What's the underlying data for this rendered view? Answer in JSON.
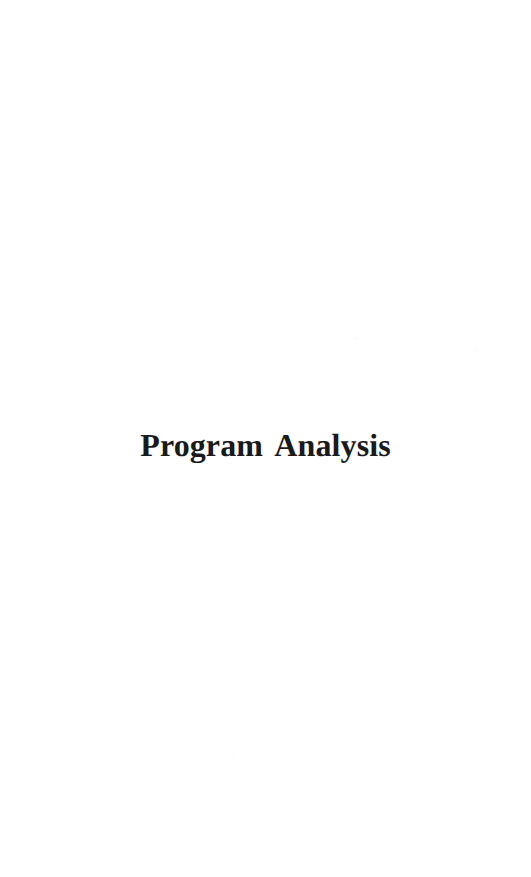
{
  "page": {
    "width": 531,
    "height": 877,
    "background_color": "#ffffff",
    "kind": "part-title-page"
  },
  "heading": {
    "text": "Program Analysis",
    "color": "#1a1a1a",
    "alignment": "center"
  },
  "artifacts": {
    "speck_color": "#fafafa"
  }
}
